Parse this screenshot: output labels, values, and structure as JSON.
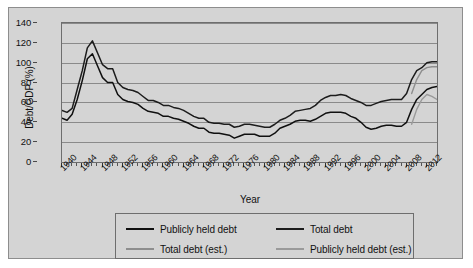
{
  "chart_data": {
    "type": "line",
    "title": "",
    "xlabel": "Year",
    "ylabel": "Debt/GDP (%)",
    "xlim": [
      1940,
      2014
    ],
    "ylim": [
      0,
      140
    ],
    "yticks": [
      0,
      20,
      40,
      60,
      80,
      100,
      120,
      140
    ],
    "xticks": [
      1940,
      1944,
      1948,
      1952,
      1956,
      1960,
      1964,
      1968,
      1972,
      1976,
      1980,
      1984,
      1988,
      1992,
      1996,
      2000,
      2004,
      2008,
      2012
    ],
    "grid": "horizontal",
    "legend_position": "below",
    "x": [
      1940,
      1941,
      1942,
      1943,
      1944,
      1945,
      1946,
      1947,
      1948,
      1949,
      1950,
      1951,
      1952,
      1953,
      1954,
      1955,
      1956,
      1957,
      1958,
      1959,
      1960,
      1961,
      1962,
      1963,
      1964,
      1965,
      1966,
      1967,
      1968,
      1969,
      1970,
      1971,
      1972,
      1973,
      1974,
      1975,
      1976,
      1977,
      1978,
      1979,
      1980,
      1981,
      1982,
      1983,
      1984,
      1985,
      1986,
      1987,
      1988,
      1989,
      1990,
      1991,
      1992,
      1993,
      1994,
      1995,
      1996,
      1997,
      1998,
      1999,
      2000,
      2001,
      2002,
      2003,
      2004,
      2005,
      2006,
      2007,
      2008,
      2009,
      2010,
      2011,
      2012,
      2013,
      2014
    ],
    "series": [
      {
        "name": "Total debt",
        "color": "#1c1c1c",
        "style": "solid",
        "values": [
          52,
          50,
          54,
          73,
          92,
          115,
          122,
          110,
          98,
          94,
          94,
          80,
          75,
          73,
          72,
          70,
          66,
          62,
          62,
          60,
          57,
          57,
          55,
          54,
          52,
          49,
          46,
          44,
          44,
          40,
          39,
          39,
          38,
          38,
          35,
          36,
          38,
          38,
          37,
          36,
          35,
          35,
          38,
          42,
          44,
          47,
          51,
          52,
          53,
          54,
          57,
          62,
          65,
          67,
          67,
          68,
          67,
          64,
          62,
          60,
          57,
          57,
          59,
          61,
          62,
          63,
          63,
          63,
          69,
          83,
          92,
          95,
          100,
          101,
          101
        ],
        "segment": "historical_through_2009"
      },
      {
        "name": "Publicly held debt",
        "color": "#101010",
        "style": "solid",
        "values": [
          44,
          42,
          48,
          63,
          82,
          104,
          109,
          97,
          85,
          80,
          80,
          68,
          63,
          61,
          60,
          58,
          54,
          51,
          50,
          49,
          46,
          46,
          44,
          43,
          41,
          39,
          36,
          34,
          34,
          30,
          29,
          29,
          28,
          27,
          24,
          26,
          28,
          28,
          28,
          26,
          26,
          26,
          29,
          34,
          36,
          38,
          41,
          42,
          42,
          41,
          43,
          46,
          49,
          50,
          50,
          50,
          49,
          46,
          44,
          40,
          35,
          33,
          34,
          36,
          37,
          37,
          36,
          36,
          40,
          53,
          63,
          68,
          73,
          75,
          76
        ],
        "segment": "historical_through_2009"
      },
      {
        "name": "Total debt (est.)",
        "color": "#8e8e8e",
        "style": "solid",
        "values": [
          69,
          83,
          92,
          95,
          96,
          96,
          95
        ],
        "x": [
          2009,
          2010,
          2011,
          2012,
          2013,
          2014,
          2015
        ],
        "segment": "estimate"
      },
      {
        "name": "Publicly held debt (est.)",
        "color": "#9a9a9a",
        "style": "solid",
        "values": [
          38,
          53,
          63,
          68,
          66,
          63,
          62
        ],
        "x": [
          2009,
          2010,
          2011,
          2012,
          2013,
          2014,
          2015
        ],
        "segment": "estimate"
      }
    ],
    "legend": [
      {
        "label": "Publicly held debt",
        "color": "#101010"
      },
      {
        "label": "Total debt",
        "color": "#1c1c1c"
      },
      {
        "label": "Total debt (est.)",
        "color": "#8e8e8e"
      },
      {
        "label": "Publicly held debt (est.)",
        "color": "#9a9a9a"
      }
    ]
  },
  "axes": {
    "y_title": "Debt/GDP (%)",
    "x_title": "Year",
    "y_labels": [
      "140",
      "120",
      "100",
      "80",
      "60",
      "40",
      "20",
      "0"
    ],
    "x_labels": [
      "1940",
      "1944",
      "1948",
      "1952",
      "1956",
      "1960",
      "1964",
      "1968",
      "1972",
      "1976",
      "1980",
      "1984",
      "1988",
      "1992",
      "1996",
      "2000",
      "2004",
      "2008",
      "2012"
    ]
  },
  "legend": {
    "entries": [
      {
        "label": "Publicly held debt"
      },
      {
        "label": "Total debt"
      },
      {
        "label": "Total debt (est.)"
      },
      {
        "label": "Publicly held debt (est.)"
      }
    ]
  },
  "colors": {
    "plot_background": "#d4d4d4",
    "frame_border": "#6e6e6e",
    "gridline": "#8a8a8a",
    "historical_total": "#1c1c1c",
    "historical_public": "#101010",
    "estimate_total": "#8e8e8e",
    "estimate_public": "#9a9a9a"
  }
}
